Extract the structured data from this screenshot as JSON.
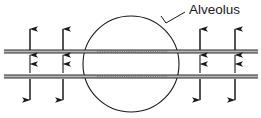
{
  "figure": {
    "labels": [
      {
        "id": "alveolus-label",
        "text": "Alveolus",
        "x": 189,
        "y": 14,
        "leader": {
          "from_x": 185,
          "from_y": 12,
          "to_x": 166,
          "to_y": 23,
          "barb_x": 161,
          "barb_y": 16
        }
      }
    ],
    "alveolus": {
      "shape": "circle",
      "cx": 131,
      "cy": 64,
      "r": 48,
      "stroke": "#1a1a1a",
      "stroke_width": 1.1,
      "fill": "none"
    },
    "membranes": [
      {
        "id": "upper-membrane",
        "y_top": 50,
        "y_bottom": 53,
        "x_start": 4,
        "x_end": 258,
        "wavy_x_start": 97,
        "wavy_x_end": 168,
        "stroke": "#2a2a2a",
        "fill": "#b8b8b8"
      },
      {
        "id": "lower-membrane",
        "y_top": 75,
        "y_bottom": 78,
        "x_start": 4,
        "x_end": 258,
        "wavy_x_start": 97,
        "wavy_x_end": 168,
        "stroke": "#2a2a2a",
        "fill": "#b8b8b8"
      }
    ],
    "arrow_columns": [
      {
        "id": "arrow-col-left-outer",
        "x": 30
      },
      {
        "id": "arrow-col-left-inner",
        "x": 63
      },
      {
        "id": "arrow-col-right-inner",
        "x": 200
      },
      {
        "id": "arrow-col-right-outer",
        "x": 235
      }
    ],
    "arrows": {
      "stroke": "#1a1a1a",
      "long_length": 20,
      "short_length": 10,
      "groups": [
        {
          "id": "above-upper-membrane-long-up",
          "direction": "up",
          "length": "long",
          "tail_y": 50,
          "head_y": 29
        },
        {
          "id": "below-upper-membrane-short-up",
          "direction": "up",
          "length": "short",
          "tail_y": 64,
          "head_y": 55
        },
        {
          "id": "above-lower-membrane-short-up",
          "direction": "up",
          "length": "short",
          "tail_y": 73,
          "head_y": 64
        },
        {
          "id": "below-lower-membrane-long-down",
          "direction": "down",
          "length": "long",
          "tail_y": 79,
          "head_y": 100
        }
      ]
    },
    "colors": {
      "ink": "#1a1a1a",
      "membrane_fill": "#b8b8b8",
      "background": "#ffffff"
    }
  }
}
